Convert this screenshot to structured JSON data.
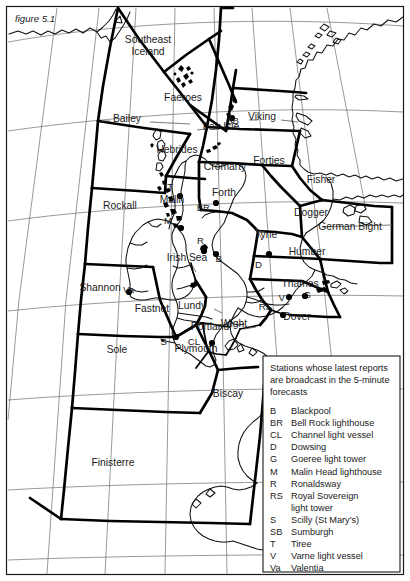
{
  "figure": {
    "caption": "figure 5.1"
  },
  "map": {
    "title": "UK Shipping Forecast sea areas",
    "sea_areas": [
      {
        "name": "Southeast Iceland",
        "lines": [
          "Southeast",
          "Iceland"
        ],
        "x": 148,
        "y": 43
      },
      {
        "name": "Faeroes",
        "x": 183,
        "y": 101
      },
      {
        "name": "Bailey",
        "x": 127,
        "y": 122
      },
      {
        "name": "Viking",
        "x": 262,
        "y": 120
      },
      {
        "name": "Fair Isle",
        "x": 221,
        "y": 130
      },
      {
        "name": "Hebrides",
        "x": 177,
        "y": 153
      },
      {
        "name": "Cromarty",
        "x": 225,
        "y": 170
      },
      {
        "name": "Forties",
        "x": 269,
        "y": 164
      },
      {
        "name": "Rockall",
        "x": 120,
        "y": 209
      },
      {
        "name": "Malin",
        "x": 172,
        "y": 203
      },
      {
        "name": "Forth",
        "x": 224,
        "y": 196
      },
      {
        "name": "Fisher",
        "x": 321,
        "y": 183
      },
      {
        "name": "Dogger",
        "x": 311,
        "y": 216
      },
      {
        "name": "German Bight",
        "x": 350,
        "y": 230
      },
      {
        "name": "Tyne",
        "x": 266,
        "y": 238
      },
      {
        "name": "Irish Sea",
        "x": 187,
        "y": 261
      },
      {
        "name": "Humber",
        "x": 307,
        "y": 255
      },
      {
        "name": "Shannon",
        "x": 100,
        "y": 291
      },
      {
        "name": "Thames",
        "x": 300,
        "y": 287
      },
      {
        "name": "Fastnet",
        "x": 152,
        "y": 312
      },
      {
        "name": "Lundy",
        "x": 192,
        "y": 309
      },
      {
        "name": "Dover",
        "x": 297,
        "y": 320
      },
      {
        "name": "Wight",
        "x": 234,
        "y": 327
      },
      {
        "name": "Portland",
        "x": 210,
        "y": 330
      },
      {
        "name": "Plymouth",
        "x": 196,
        "y": 352
      },
      {
        "name": "Sole",
        "x": 117,
        "y": 353
      },
      {
        "name": "Biscay",
        "x": 228,
        "y": 397
      },
      {
        "name": "Finisterre",
        "x": 113,
        "y": 466
      }
    ],
    "stations": [
      {
        "code": "SB",
        "label_x": 239,
        "label_y": 124,
        "dot_x": 232,
        "dot_y": 118
      },
      {
        "code": "T",
        "label_x": 173,
        "label_y": 190,
        "dot_x": 180,
        "dot_y": 196
      },
      {
        "code": "M",
        "label_x": 172,
        "label_y": 224,
        "dot_x": 181,
        "dot_y": 228
      },
      {
        "code": "BR",
        "label_x": 210,
        "label_y": 211,
        "dot_x": 216,
        "dot_y": 203
      },
      {
        "code": "R",
        "label_x": 204,
        "label_y": 244,
        "dot_x": 204,
        "dot_y": 251
      },
      {
        "code": "B",
        "label_x": 222,
        "label_y": 262,
        "dot_x": 216,
        "dot_y": 254
      },
      {
        "code": "D",
        "label_x": 262,
        "label_y": 268,
        "dot_x": 269,
        "dot_y": 254
      },
      {
        "code": "Va",
        "label_x": 134,
        "label_y": 293,
        "dot_x": 129,
        "dot_y": 292
      },
      {
        "code": "S",
        "label_x": 167,
        "label_y": 345,
        "dot_x": 176,
        "dot_y": 337
      },
      {
        "code": "CL",
        "label_x": 200,
        "label_y": 345,
        "dot_x": 212,
        "dot_y": 343
      },
      {
        "code": "RS",
        "label_x": 272,
        "label_y": 310,
        "dot_x": 283,
        "dot_y": 315
      },
      {
        "code": "V",
        "label_x": 285,
        "label_y": 301,
        "dot_x": 289,
        "dot_y": 297
      },
      {
        "code": "G",
        "label_x": 311,
        "label_y": 298,
        "dot_x": 305,
        "dot_y": 296
      }
    ]
  },
  "legend": {
    "heading": "Stations whose latest reports are broadcast in the 5-minute forecasts",
    "heading_lines": [
      "Stations whose latest reports",
      "are broadcast in the 5-minute",
      "forecasts"
    ],
    "entries": [
      {
        "key": "B",
        "value": "Blackpool"
      },
      {
        "key": "BR",
        "value": "Bell Rock lighthouse"
      },
      {
        "key": "CL",
        "value": "Channel light vessel"
      },
      {
        "key": "D",
        "value": "Dowsing"
      },
      {
        "key": "G",
        "value": "Goeree light tower"
      },
      {
        "key": "M",
        "value": "Malin Head lighthouse"
      },
      {
        "key": "R",
        "value": "Ronaldsway"
      },
      {
        "key": "RS",
        "value": "Royal Sovereign",
        "value2": "light tower"
      },
      {
        "key": "S",
        "value": "Scilly (St Mary's)"
      },
      {
        "key": "SB",
        "value": "Sumburgh"
      },
      {
        "key": "T",
        "value": "Tiree"
      },
      {
        "key": "V",
        "value": "Varne light vessel"
      },
      {
        "key": "Va",
        "value": "Valentia"
      }
    ]
  },
  "colors": {
    "ink": "#1a1a1a",
    "boundary": "#000000",
    "graticule": "#777777",
    "background": "#ffffff"
  }
}
